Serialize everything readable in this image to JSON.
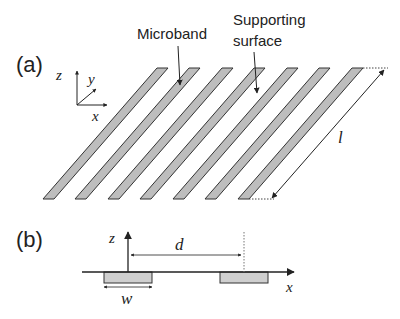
{
  "panels": {
    "a": {
      "label": "(a)",
      "annotations": {
        "microband": "Microband",
        "supporting_line1": "Supporting",
        "supporting_line2": "surface",
        "length_symbol": "l"
      },
      "axes": {
        "z": "z",
        "y": "y",
        "x": "x"
      },
      "strip_count": 7,
      "strip_fill": "#bdbdbd",
      "strip_stroke": "#333333"
    },
    "b": {
      "label": "(b)",
      "axes": {
        "z": "z",
        "x": "x"
      },
      "spacing_symbol": "d",
      "width_symbol": "w"
    }
  }
}
